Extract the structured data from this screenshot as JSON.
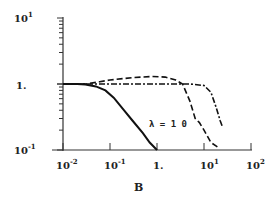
{
  "chart_data": {
    "type": "line",
    "title": "",
    "xlabel": "B",
    "ylabel": "",
    "xscale": "log",
    "yscale": "log",
    "xlim": [
      0.01,
      100
    ],
    "ylim": [
      0.1,
      10
    ],
    "grid": false,
    "legend": null,
    "x_tick_labels": [
      "10^-2",
      "10^-1",
      "1.",
      "10^1",
      "10^2"
    ],
    "y_tick_labels": [
      "10^-1",
      "1.",
      "10^1"
    ],
    "annotations": [
      {
        "text": "λ = 1 0",
        "x": 1.3,
        "y": 0.3
      }
    ],
    "series": [
      {
        "name": "solid",
        "style": "solid",
        "x": [
          0.01,
          0.02,
          0.03,
          0.05,
          0.08,
          0.12,
          0.2,
          0.3,
          0.5,
          0.7,
          1.0
        ],
        "y": [
          1.0,
          1.0,
          0.98,
          0.92,
          0.8,
          0.62,
          0.4,
          0.28,
          0.18,
          0.13,
          0.1
        ]
      },
      {
        "name": "dashed",
        "style": "dashed",
        "x": [
          0.01,
          0.03,
          0.06,
          0.1,
          0.3,
          0.8,
          1.5,
          2.5,
          3.5,
          5.0,
          6.5,
          8.0,
          10.0,
          14.0,
          20.0
        ],
        "y": [
          1.0,
          1.0,
          1.08,
          1.15,
          1.25,
          1.3,
          1.27,
          1.15,
          1.0,
          0.55,
          0.3,
          0.26,
          0.2,
          0.13,
          0.11
        ]
      },
      {
        "name": "dash-dot",
        "style": "dashdot",
        "x": [
          0.01,
          0.1,
          1.0,
          5.0,
          10.0,
          14.0,
          18.0,
          22.0,
          25.0
        ],
        "y": [
          1.0,
          1.0,
          1.0,
          1.0,
          0.95,
          0.75,
          0.45,
          0.28,
          0.22
        ]
      }
    ]
  },
  "labels": {
    "x_axis_title": "B",
    "annotation": "λ = 1 0",
    "xt0_base": "10",
    "xt0_exp": "-2",
    "xt1_base": "10",
    "xt1_exp": "-1",
    "xt2": "1.",
    "xt3_base": "10",
    "xt3_exp": "1",
    "xt4_base": "10",
    "xt4_exp": "2",
    "yt0_base": "10",
    "yt0_exp": "-1",
    "yt1": "1.",
    "yt2_base": "10",
    "yt2_exp": "1"
  }
}
